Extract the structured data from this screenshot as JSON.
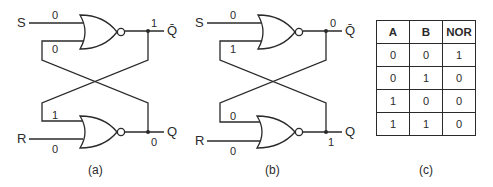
{
  "panels": [
    {
      "caption": "(a)",
      "top_gate": {
        "input_set_label": "S",
        "input_set_value": "0",
        "feedback_value": "0",
        "output_value": "1",
        "output_label": "Q̄"
      },
      "bottom_gate": {
        "input_reset_label": "R",
        "input_reset_value": "0",
        "feedback_value": "1",
        "output_value": "0",
        "output_label": "Q"
      }
    },
    {
      "caption": "(b)",
      "top_gate": {
        "input_set_label": "S",
        "input_set_value": "0",
        "feedback_value": "1",
        "output_value": "0",
        "output_label": "Q̄"
      },
      "bottom_gate": {
        "input_reset_label": "R",
        "input_reset_value": "0",
        "feedback_value": "0",
        "output_value": "1",
        "output_label": "Q"
      }
    }
  ],
  "truth_table": {
    "caption": "(c)",
    "headers": [
      "A",
      "B",
      "NOR"
    ],
    "rows": [
      [
        "0",
        "0",
        "1"
      ],
      [
        "0",
        "1",
        "0"
      ],
      [
        "1",
        "0",
        "0"
      ],
      [
        "1",
        "1",
        "0"
      ]
    ]
  }
}
